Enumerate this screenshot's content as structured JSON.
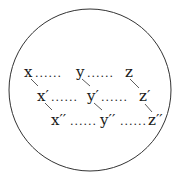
{
  "diagram": {
    "shape": "circle",
    "rows": [
      {
        "labels": [
          "x",
          "y",
          "z"
        ]
      },
      {
        "labels": [
          "x′",
          "y′",
          "z′"
        ]
      },
      {
        "labels": [
          "x′′",
          "y′′",
          "z′′"
        ]
      }
    ],
    "separator": "......",
    "colors": {
      "stroke": "#333333",
      "text": "#1a1a1a",
      "background": "#ffffff"
    }
  }
}
